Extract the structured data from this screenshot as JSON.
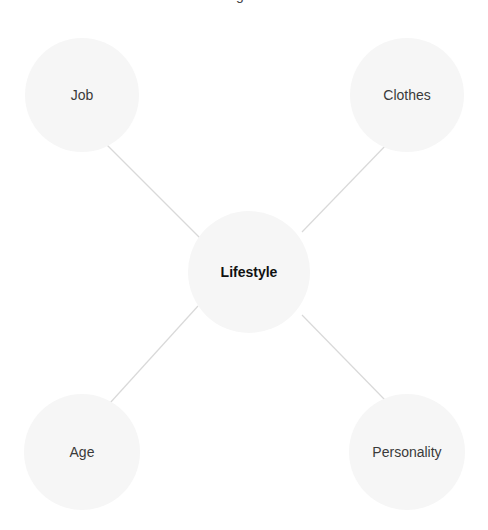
{
  "diagram": {
    "type": "mind-map",
    "clipped_title_fragment": "g",
    "colors": {
      "node_fill": "#f6f6f6",
      "edge": "#d9d9d9",
      "center_text": "#111111",
      "leaf_text": "#3a3a3a",
      "background": "#ffffff"
    },
    "center": {
      "label": "Lifestyle",
      "cx": 249,
      "cy": 272,
      "r": 61
    },
    "nodes": [
      {
        "id": "job",
        "label": "Job",
        "cx": 82,
        "cy": 95,
        "r": 57
      },
      {
        "id": "clothes",
        "label": "Clothes",
        "cx": 407,
        "cy": 95,
        "r": 57
      },
      {
        "id": "age",
        "label": "Age",
        "cx": 82,
        "cy": 452,
        "r": 58
      },
      {
        "id": "personality",
        "label": "Personality",
        "cx": 407,
        "cy": 452,
        "r": 58
      }
    ],
    "edges": [
      {
        "from": "job",
        "to": "center",
        "x1": 107,
        "y1": 145,
        "x2": 201,
        "y2": 239
      },
      {
        "from": "clothes",
        "to": "center",
        "x1": 388,
        "y1": 143,
        "x2": 302,
        "y2": 232
      },
      {
        "from": "age",
        "to": "center",
        "x1": 110,
        "y1": 403,
        "x2": 198,
        "y2": 306
      },
      {
        "from": "personality",
        "to": "center",
        "x1": 385,
        "y1": 400,
        "x2": 302,
        "y2": 315
      }
    ]
  }
}
